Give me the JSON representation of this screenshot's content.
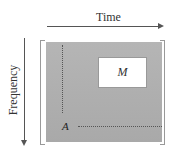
{
  "diagram": {
    "x_axis": {
      "label": "Time",
      "direction": "right",
      "icon": "arrow-right-icon"
    },
    "y_axis": {
      "label": "Frequency",
      "direction": "down",
      "icon": "arrow-down-icon"
    },
    "region_box": {
      "label": "M",
      "fill": "#ffffff"
    },
    "corner_label": "A",
    "colors": {
      "spectrogram_fill": "#b0b0b0",
      "axis_line": "#555555",
      "bracket": "#999999",
      "dotted_line": "#555555"
    }
  }
}
